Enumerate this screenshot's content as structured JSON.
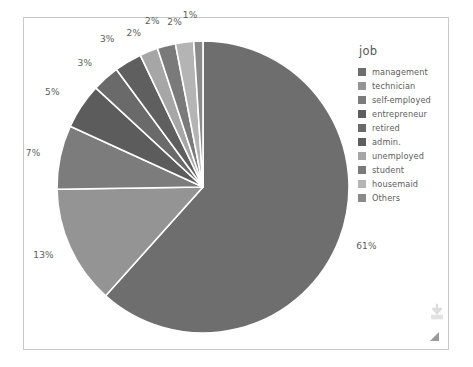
{
  "chart_data": {
    "type": "pie",
    "title": "",
    "legend_title": "job",
    "legend_position": "right",
    "categories": [
      "management",
      "technician",
      "self-employed",
      "entrepreneur",
      "retired",
      "admin.",
      "unemployed",
      "student",
      "housemaid",
      "Others"
    ],
    "values": [
      61,
      13,
      7,
      5,
      3,
      3,
      2,
      2,
      2,
      1
    ],
    "value_labels": [
      "61%",
      "13%",
      "7%",
      "5%",
      "3%",
      "3%",
      "2%",
      "2%",
      "2%",
      "1%"
    ],
    "unit": "%",
    "colors": [
      "#6e6e6e",
      "#949494",
      "#7c7c7c",
      "#5c5c5c",
      "#6a6a6a",
      "#5f5f5f",
      "#a6a6a6",
      "#7a7a7a",
      "#b4b4b4",
      "#8a8a8a"
    ],
    "start_angle_deg": 0,
    "direction": "clockwise"
  },
  "legend": {
    "title": "job",
    "items": [
      {
        "label": "management",
        "color": "#6e6e6e"
      },
      {
        "label": "technician",
        "color": "#949494"
      },
      {
        "label": "self-employed",
        "color": "#7c7c7c"
      },
      {
        "label": "entrepreneur",
        "color": "#5c5c5c"
      },
      {
        "label": "retired",
        "color": "#6a6a6a"
      },
      {
        "label": "admin.",
        "color": "#5f5f5f"
      },
      {
        "label": "unemployed",
        "color": "#a6a6a6"
      },
      {
        "label": "student",
        "color": "#7a7a7a"
      },
      {
        "label": "housemaid",
        "color": "#b4b4b4"
      },
      {
        "label": "Others",
        "color": "#8a8a8a"
      }
    ]
  },
  "overlay": {
    "download_icon": "download-icon",
    "resize_handle": "resize-handle-icon"
  }
}
